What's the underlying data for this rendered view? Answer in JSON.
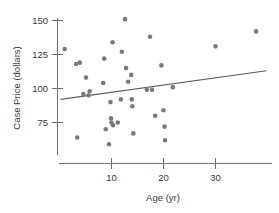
{
  "chart_data": {
    "type": "scatter",
    "title": "",
    "xlabel": "Age (yr)",
    "ylabel": "Case Price (dollars)",
    "xlim": [
      0,
      40
    ],
    "ylim": [
      55,
      155
    ],
    "grid": false,
    "legend": null,
    "xticks": [
      10,
      20,
      30
    ],
    "yticks": [
      75,
      100,
      125,
      150
    ],
    "xtick_labels": [
      "10",
      "20",
      "30"
    ],
    "ytick_labels": [
      "75",
      "100",
      "125",
      "150"
    ],
    "point_color": "#7a7a7a",
    "line_color": "#5d5d5d",
    "axis_color": "#6e6e6e",
    "points": [
      {
        "x": 1.0,
        "y": 129
      },
      {
        "x": 3.2,
        "y": 118
      },
      {
        "x": 3.9,
        "y": 119
      },
      {
        "x": 3.4,
        "y": 64
      },
      {
        "x": 4.6,
        "y": 96
      },
      {
        "x": 5.1,
        "y": 108
      },
      {
        "x": 5.6,
        "y": 95
      },
      {
        "x": 5.8,
        "y": 98
      },
      {
        "x": 8.4,
        "y": 104
      },
      {
        "x": 8.6,
        "y": 122
      },
      {
        "x": 8.9,
        "y": 70
      },
      {
        "x": 9.5,
        "y": 59
      },
      {
        "x": 9.8,
        "y": 90
      },
      {
        "x": 9.9,
        "y": 78
      },
      {
        "x": 10.0,
        "y": 75
      },
      {
        "x": 10.2,
        "y": 134
      },
      {
        "x": 10.3,
        "y": 73
      },
      {
        "x": 11.2,
        "y": 75
      },
      {
        "x": 11.8,
        "y": 92
      },
      {
        "x": 12.0,
        "y": 127
      },
      {
        "x": 12.6,
        "y": 151
      },
      {
        "x": 12.8,
        "y": 115
      },
      {
        "x": 13.2,
        "y": 105
      },
      {
        "x": 13.8,
        "y": 110
      },
      {
        "x": 13.9,
        "y": 92
      },
      {
        "x": 14.0,
        "y": 87
      },
      {
        "x": 14.2,
        "y": 67
      },
      {
        "x": 16.8,
        "y": 99
      },
      {
        "x": 17.4,
        "y": 138
      },
      {
        "x": 17.8,
        "y": 99
      },
      {
        "x": 18.4,
        "y": 80
      },
      {
        "x": 19.6,
        "y": 117
      },
      {
        "x": 20.0,
        "y": 84
      },
      {
        "x": 20.2,
        "y": 72
      },
      {
        "x": 20.3,
        "y": 62
      },
      {
        "x": 21.8,
        "y": 101
      },
      {
        "x": 30.0,
        "y": 131
      },
      {
        "x": 37.8,
        "y": 142
      }
    ],
    "fit_line": {
      "x_start": 0.2,
      "y_start": 92,
      "x_end": 39.8,
      "y_end": 113
    }
  }
}
